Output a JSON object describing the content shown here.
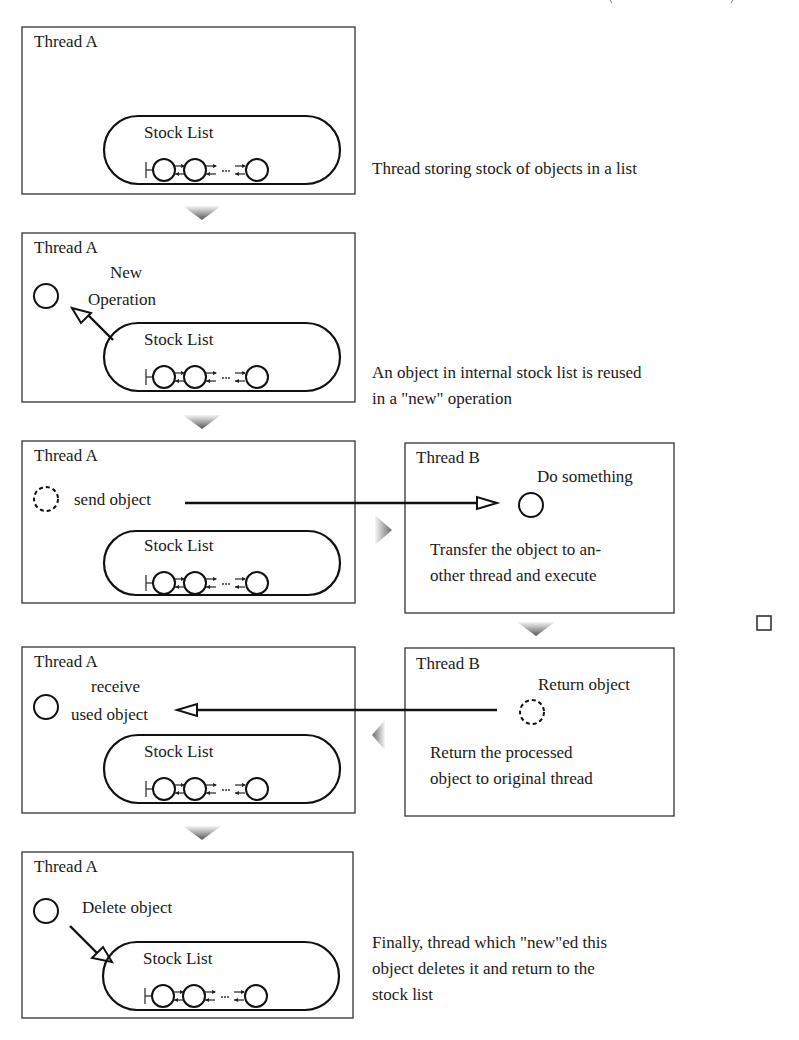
{
  "title_fragment": ", ,",
  "stock_list_label": "Stock List",
  "ellipsis": "...",
  "steps": [
    {
      "id": "step1",
      "thread_label": "Thread A",
      "description": [
        "Thread storing stock of objects in a list"
      ]
    },
    {
      "id": "step2",
      "thread_label": "Thread A",
      "action_label": [
        "New",
        "Operation"
      ],
      "description": [
        "An object in internal stock list is reused",
        "in a \"new\" operation"
      ]
    },
    {
      "id": "step3",
      "thread_label": "Thread A",
      "action_label": [
        "send object"
      ],
      "other_thread": {
        "thread_label": "Thread B",
        "action_label": "Do something",
        "description": [
          "Transfer the object to an-",
          "other thread and execute"
        ]
      }
    },
    {
      "id": "step4",
      "thread_label": "Thread A",
      "action_label": [
        "receive",
        "used object"
      ],
      "other_thread": {
        "thread_label": "Thread B",
        "action_label": "Return object",
        "description": [
          "Return the processed",
          "object to original thread"
        ]
      }
    },
    {
      "id": "step5",
      "thread_label": "Thread A",
      "action_label": [
        "Delete object"
      ],
      "description": [
        "Finally, thread which \"new\"ed this",
        "object deletes it and return to the",
        "stock list"
      ]
    }
  ],
  "colors": {
    "ink": "#111111",
    "box_border": "#333333",
    "flow_arrow_dark": "#555555",
    "flow_arrow_light": "#f4f4f4",
    "background": "#ffffff"
  }
}
